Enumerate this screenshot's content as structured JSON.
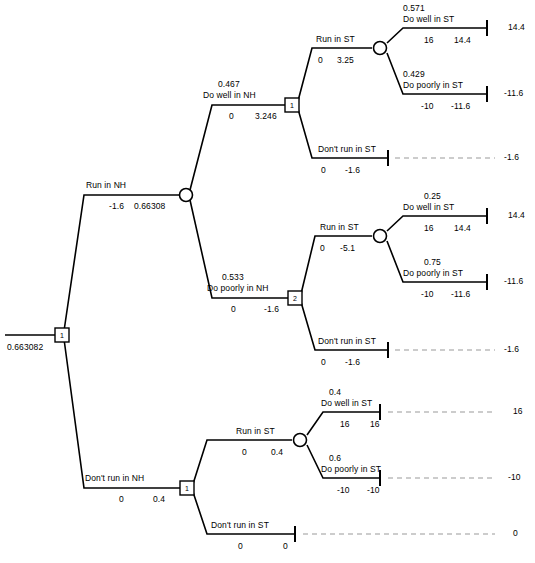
{
  "diagram": {
    "type": "decision-tree",
    "title": "",
    "root": {
      "node_label": "1",
      "node_type": "decision",
      "value": "0.663082"
    },
    "colors": {
      "line": "#000000",
      "dashed": "#999999",
      "background": "#ffffff",
      "text": "#000000"
    },
    "branches": {
      "run_in_nh": {
        "label": "Run in NH",
        "cost": "-1.6",
        "value": "0.66308",
        "node_type": "chance"
      },
      "dont_run_in_nh": {
        "label": "Don't run in NH",
        "cost": "0",
        "value": "0.4",
        "node_label": "1",
        "node_type": "decision"
      },
      "do_well_in_nh": {
        "prob": "0.467",
        "label": "Do well in NH",
        "cost": "0",
        "value": "3.246",
        "node_label": "1",
        "node_type": "decision"
      },
      "do_poorly_in_nh": {
        "prob": "0.533",
        "label": "Do poorly in NH",
        "cost": "0",
        "value": "-1.6",
        "node_label": "2",
        "node_type": "decision"
      }
    },
    "subtree_top": {
      "run_in_st": {
        "label": "Run in ST",
        "cost": "0",
        "value": "3.25",
        "node_type": "chance"
      },
      "dont_run_in_st": {
        "label": "Don't run in ST",
        "cost": "0",
        "value": "-1.6",
        "payoff": "-1.6"
      },
      "do_well_in_st": {
        "prob": "0.571",
        "label": "Do well in ST",
        "cost": "16",
        "value": "14.4",
        "payoff": "14.4"
      },
      "do_poorly_in_st": {
        "prob": "0.429",
        "label": "Do poorly in ST",
        "cost": "-10",
        "value": "-11.6",
        "payoff": "-11.6"
      }
    },
    "subtree_middle": {
      "run_in_st": {
        "label": "Run in ST",
        "cost": "0",
        "value": "-5.1",
        "node_type": "chance"
      },
      "dont_run_in_st": {
        "label": "Don't run in ST",
        "cost": "0",
        "value": "-1.6",
        "payoff": "-1.6"
      },
      "do_well_in_st": {
        "prob": "0.25",
        "label": "Do well in ST",
        "cost": "16",
        "value": "14.4",
        "payoff": "14.4"
      },
      "do_poorly_in_st": {
        "prob": "0.75",
        "label": "Do poorly in ST",
        "cost": "-10",
        "value": "-11.6",
        "payoff": "-11.6"
      }
    },
    "subtree_bottom": {
      "run_in_st": {
        "label": "Run in ST",
        "cost": "0",
        "value": "0.4",
        "node_type": "chance"
      },
      "dont_run_in_st": {
        "label": "Don't run in ST",
        "cost": "0",
        "value": "0",
        "payoff": "0"
      },
      "do_well_in_st": {
        "prob": "0.4",
        "label": "Do well in ST",
        "cost": "16",
        "value": "16",
        "payoff": "16"
      },
      "do_poorly_in_st": {
        "prob": "0.6",
        "label": "Do poorly in ST",
        "cost": "-10",
        "value": "-10",
        "payoff": "-10"
      }
    }
  }
}
